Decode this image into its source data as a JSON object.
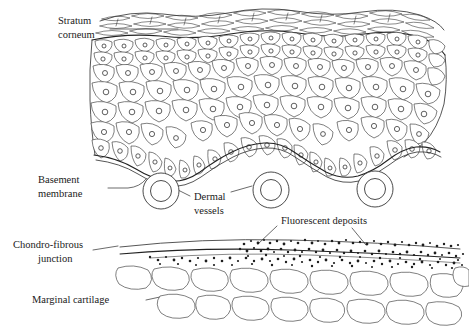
{
  "figure": {
    "background_color": "#ffffff",
    "ink_color": "#2b2b2b",
    "deposit_color": "#1d1d1d"
  },
  "labels": {
    "stratum_corneum": "Stratum\ncorneum",
    "stratum_corneum_line1": "Stratum",
    "stratum_corneum_line2": "corneum",
    "basement_membrane_line1": "Basement",
    "basement_membrane_line2": "membrane",
    "dermal_vessels_line1": "Dermal",
    "dermal_vessels_line2": "vessels",
    "fluorescent_deposits": "Fluorescent deposits",
    "chondro_fibrous_line1": "Chondro-fibrous",
    "chondro_fibrous_line2": "junction",
    "marginal_cartilage": "Marginal cartilage"
  },
  "structures": {
    "stratum_corneum": {
      "name": "Stratum corneum",
      "description": "Layer of flattened overlapping keratinised cells at the epidermal surface",
      "cell_count": 46
    },
    "epidermis": {
      "name": "Epidermis",
      "description": "Stratified polygonal cells each containing a round nucleus",
      "cell_count": 118
    },
    "basement_membrane": {
      "name": "Basement membrane",
      "description": "Wavy boundary line beneath the epidermal basal cell layer",
      "wave_count": 3
    },
    "dermal_vessels": {
      "name": "Dermal vessels",
      "description": "Three concentric ring profiles in the dermis",
      "count": 3,
      "positions": [
        {
          "cx": 161,
          "cy": 191,
          "r_outer": 18,
          "r_inner": 10
        },
        {
          "cx": 271,
          "cy": 190,
          "r_outer": 18,
          "r_inner": 10
        },
        {
          "cx": 375,
          "cy": 189,
          "r_outer": 18,
          "r_inner": 10
        }
      ]
    },
    "chondro_fibrous_junction": {
      "name": "Chondro-fibrous junction",
      "description": "Two gently curving parallel lines separating fibrous tissue from cartilage"
    },
    "fluorescent_deposits": {
      "name": "Fluorescent deposits",
      "description": "Dense stippled granules concentrated along the chondro-fibrous junction",
      "dot_count": 210
    },
    "marginal_cartilage": {
      "name": "Marginal cartilage",
      "description": "Two rows of irregular rounded cartilage lacunae",
      "row_count": 2,
      "cell_count": 19
    }
  }
}
